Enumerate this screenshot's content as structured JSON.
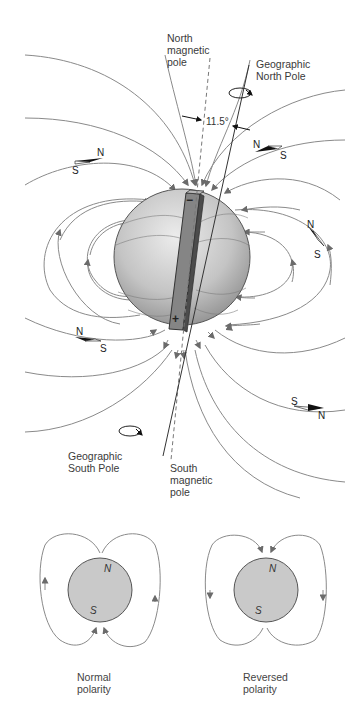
{
  "main_diagram": {
    "labels": {
      "north_magnetic_pole": "North\nmagnetic\npole",
      "geographic_north_pole": "Geographic\nNorth Pole",
      "geographic_south_pole": "Geographic\nSouth Pole",
      "south_magnetic_pole": "South\nmagnetic\npole",
      "tilt_angle": "11.5°"
    },
    "magnet": {
      "top_sign": "−",
      "bottom_sign": "+"
    },
    "compass_needles": [
      {
        "n": "N",
        "s": "S"
      },
      {
        "n": "N",
        "s": "S"
      },
      {
        "n": "N",
        "s": "S"
      },
      {
        "n": "N",
        "s": "S"
      },
      {
        "n": "N",
        "s": "S"
      }
    ],
    "colors": {
      "field_line": "#8a8a8a",
      "arrow": "#6b6b6b",
      "sphere_light": "#e6e6e6",
      "sphere_dark": "#9a9a9a",
      "magnet": "#7d7d7d"
    }
  },
  "polarity_diagrams": [
    {
      "caption": "Normal\npolarity",
      "top_letter": "N",
      "bottom_letter": "S"
    },
    {
      "caption": "Reversed\npolarity",
      "top_letter": "N",
      "bottom_letter": "S"
    }
  ]
}
